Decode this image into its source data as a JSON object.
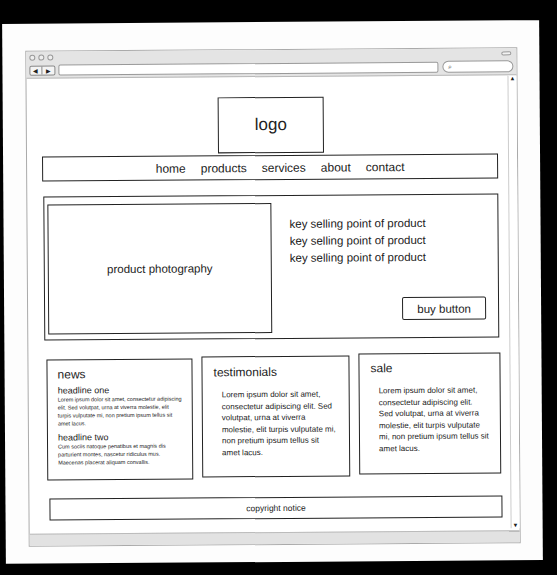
{
  "browser": {
    "back_label": "◀",
    "forward_label": "▶",
    "url_value": "",
    "search_icon": "🔍",
    "search_value": "",
    "scroll_up": "▲",
    "scroll_down": "▼"
  },
  "header": {
    "logo_label": "logo"
  },
  "nav": {
    "items": [
      "home",
      "products",
      "services",
      "about",
      "contact"
    ]
  },
  "hero": {
    "photo_label": "product photography",
    "selling_points": [
      "key selling point of product",
      "key selling point of product",
      "key selling point of product"
    ],
    "buy_label": "buy button"
  },
  "news": {
    "title": "news",
    "items": [
      {
        "headline": "headline one",
        "body": "Lorem ipsum dolor sit amet, consectetur adipiscing elit. Sed volutpat, urna at viverra molestie, elit turpis vulputate mi, non pretium ipsum tellus sit amet lacus."
      },
      {
        "headline": "headline two",
        "body": "Cum sociis natoque penatibus et magnis dis parturient montes, nascetur ridiculus mus. Maecenas placerat aliquam convallis."
      }
    ]
  },
  "testimonials": {
    "title": "testimonials",
    "body": "Lorem ipsum dolor sit amet, consectetur adipiscing elit. Sed volutpat, urna at viverra molestie, elit turpis vulputate mi, non pretium ipsum tellus sit amet lacus."
  },
  "sale": {
    "title": "sale",
    "body": "Lorem ipsum dolor sit amet, consectetur adipiscing elit. Sed volutpat, urna at viverra molestie, elit turpis vulputate mi, non pretium ipsum tellus sit amet lacus."
  },
  "footer": {
    "copyright_label": "copyright notice"
  }
}
